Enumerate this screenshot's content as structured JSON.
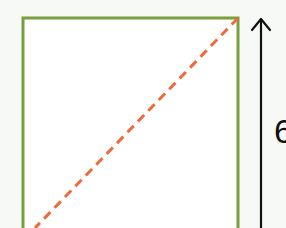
{
  "diagram": {
    "shape": "square",
    "height_label": "6",
    "colors": {
      "background": "#f7f9f7",
      "square_fill": "#ffffff",
      "square_stroke": "#78a03c",
      "diagonal": "#ee6a3a",
      "arrow": "#111111"
    }
  }
}
